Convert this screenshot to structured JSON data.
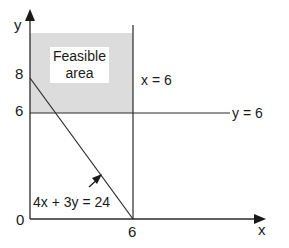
{
  "diagram": {
    "type": "linear-programming-graph",
    "axes": {
      "x_label": "x",
      "y_label": "y",
      "origin_label": "0",
      "x_ticks": [
        {
          "value": 6,
          "label": "6"
        }
      ],
      "y_ticks": [
        {
          "value": 8,
          "label": "8"
        },
        {
          "value": 6,
          "label": "6"
        }
      ]
    },
    "constraints": [
      {
        "id": "line-x6",
        "label": "x = 6",
        "kind": "vertical",
        "value": 6
      },
      {
        "id": "line-y6",
        "label": "y = 6",
        "kind": "horizontal",
        "value": 6
      },
      {
        "id": "line-budget",
        "label": "4x + 3y = 24",
        "kind": "line",
        "points": [
          [
            0,
            8
          ],
          [
            6,
            0
          ]
        ],
        "arrow_direction": "toward origin side"
      }
    ],
    "region": {
      "label_line1": "Feasible",
      "label_line2": "area",
      "fill_color": "#dcdcdc",
      "bounds": "0 ≤ x ≤ 6, y ≥ 6"
    },
    "colors": {
      "line": "#2a2a2a",
      "shade": "#dcdcdc",
      "background": "#ffffff"
    }
  }
}
